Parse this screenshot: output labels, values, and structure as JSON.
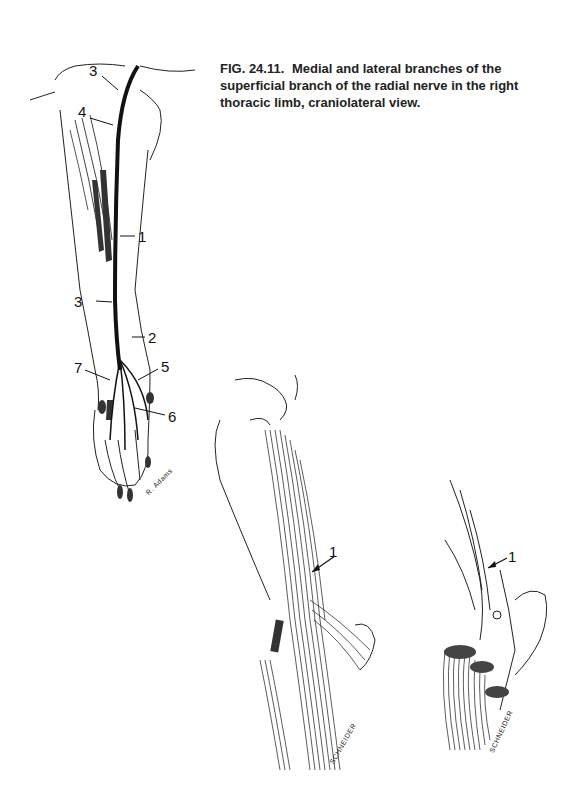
{
  "caption": {
    "figure_number": "FIG. 24.11.",
    "text": "Medial and lateral branches of the superficial branch of the radial nerve in the right thoracic limb, craniolateral view."
  },
  "figures": {
    "limb": {
      "labels": [
        "3",
        "4",
        "1",
        "3",
        "2",
        "7",
        "5",
        "6"
      ],
      "signature": "R. Adams"
    },
    "elbow_a": {
      "labels": [
        "1"
      ],
      "signature": "SCHNEIDER"
    },
    "elbow_b": {
      "labels": [
        "1"
      ],
      "signature": "SCHNEIDER"
    }
  },
  "colors": {
    "background": "#ffffff",
    "ink": "#1a1a1a"
  }
}
